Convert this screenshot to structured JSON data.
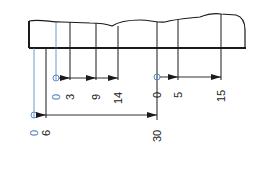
{
  "diagram": {
    "colors": {
      "line": "#1a1a1a",
      "reference": "#4a7fc1",
      "background": "#ffffff"
    },
    "dimension_groups": [
      {
        "name": "lower-chain",
        "origin_label": "0",
        "origin_color": "reference",
        "values": [
          "6",
          "30"
        ]
      },
      {
        "name": "upper-left-chain",
        "origin_label": "0",
        "origin_color": "reference",
        "values": [
          "3",
          "9",
          "14"
        ]
      },
      {
        "name": "upper-right-chain",
        "origin_label": "0",
        "origin_color": "line",
        "values": [
          "5",
          "15"
        ]
      }
    ]
  }
}
